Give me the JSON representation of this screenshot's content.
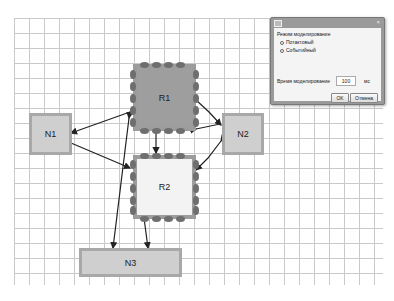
{
  "diagram": {
    "nodes": [
      {
        "id": "N1",
        "label": "N1"
      },
      {
        "id": "N2",
        "label": "N2"
      },
      {
        "id": "N3",
        "label": "N3"
      }
    ],
    "resources": [
      {
        "id": "R1",
        "label": "R1"
      },
      {
        "id": "R2",
        "label": "R2"
      }
    ],
    "links": [
      {
        "from": "R1",
        "to": "N1"
      },
      {
        "from": "N1",
        "to": "R2"
      },
      {
        "from": "R1",
        "to": "N2"
      },
      {
        "from": "N2",
        "to": "R2"
      },
      {
        "from": "R1",
        "to": "R2"
      },
      {
        "from": "R1",
        "to": "N3"
      },
      {
        "from": "R2",
        "to": "N3"
      }
    ]
  },
  "dialog": {
    "title_icon": "app-icon",
    "close_label": "×",
    "mode_group_label": "Режим моделирование",
    "mode_options": [
      {
        "label": "Потактовый",
        "selected": true
      },
      {
        "label": "Событийный",
        "selected": false
      }
    ],
    "time_label": "Время моделирование",
    "time_value": "100",
    "time_unit": "мс",
    "ok_label": "OK",
    "cancel_label": "Отмена"
  }
}
